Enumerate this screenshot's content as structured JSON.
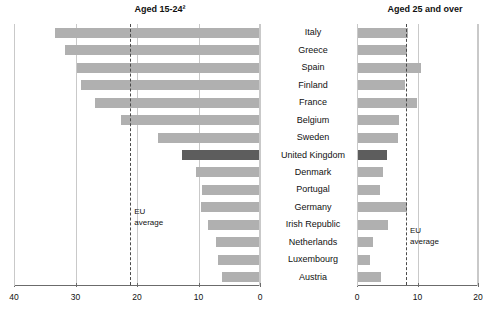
{
  "chart_data": {
    "type": "bar",
    "orientation": "horizontal",
    "layout": "two-panel mirrored (butterfly) bar chart",
    "grid": true,
    "legend": null,
    "categories": [
      "Italy",
      "Greece",
      "Spain",
      "Finland",
      "France",
      "Belgium",
      "Sweden",
      "United Kingdom",
      "Denmark",
      "Portugal",
      "Germany",
      "Irish Republic",
      "Netherlands",
      "Luxembourg",
      "Austria"
    ],
    "panels": [
      {
        "id": "left",
        "title": "Aged 15-24²",
        "direction": "right-to-left",
        "xlabel": "",
        "ylabel": "",
        "xlim": [
          40,
          0
        ],
        "ticks": [
          40,
          30,
          20,
          10,
          0
        ],
        "tick_labels": [
          "40",
          "30",
          "20",
          "10",
          "0"
        ],
        "reference_line": {
          "label_line1": "EU",
          "label_line2": "average",
          "value": 21.1
        },
        "values": [
          33.3,
          31.7,
          29.8,
          29.1,
          26.8,
          22.6,
          16.6,
          12.7,
          10.4,
          9.4,
          9.6,
          8.5,
          7.2,
          6.9,
          6.2
        ]
      },
      {
        "id": "right",
        "title": "Aged 25 and over",
        "direction": "left-to-right",
        "xlabel": "",
        "ylabel": "",
        "xlim": [
          0,
          20
        ],
        "ticks": [
          0,
          10,
          20
        ],
        "tick_labels": [
          "0",
          "10",
          "20"
        ],
        "reference_line": {
          "label_line1": "EU",
          "label_line2": "average",
          "value": 8.1
        },
        "values": [
          8.4,
          8.3,
          10.6,
          7.9,
          9.9,
          6.9,
          6.8,
          5.0,
          4.3,
          3.8,
          8.2,
          5.2,
          2.6,
          2.2,
          4.0
        ]
      }
    ],
    "highlight_category": "United Kingdom",
    "colors": {
      "bar": "#b0b0b0",
      "bar_highlight": "#5d5d5d",
      "grid": "#c9c9c9",
      "axis": "#6b6b6b",
      "reference_line": "#4a4a4a",
      "text": "#111111",
      "background": "#ffffff"
    }
  }
}
